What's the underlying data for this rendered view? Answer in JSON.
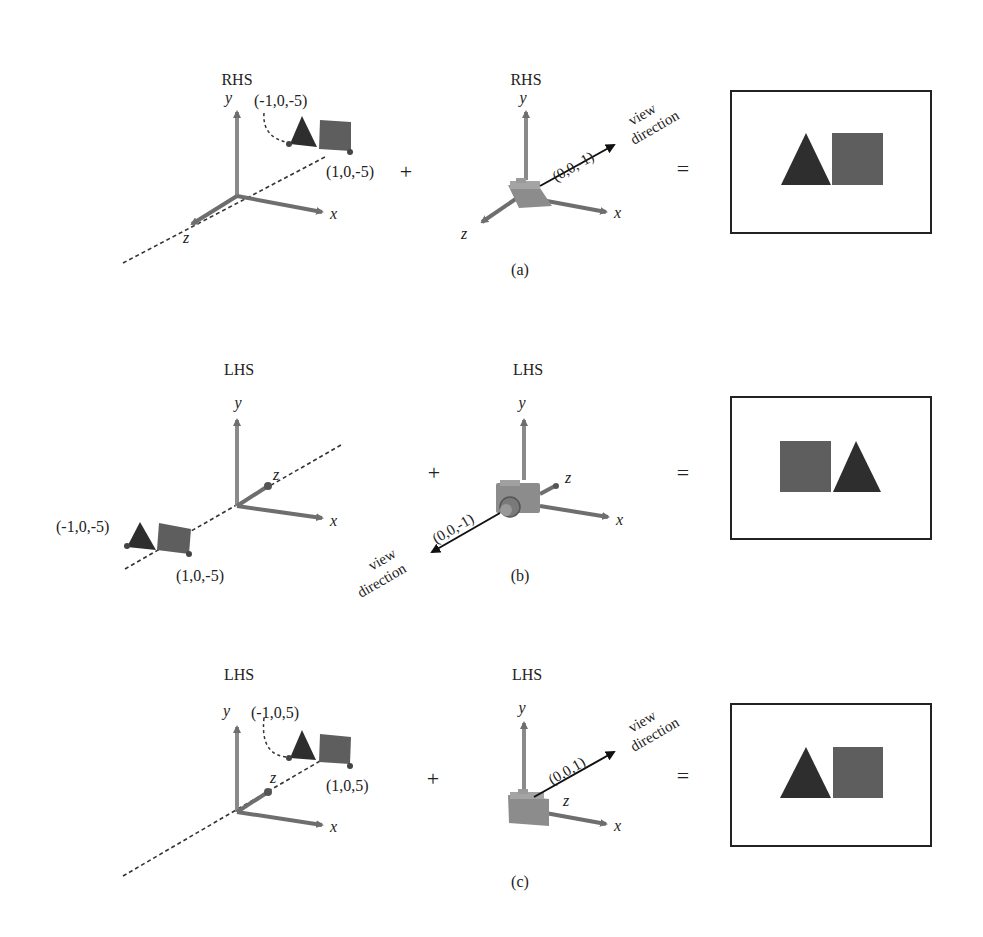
{
  "figure": {
    "panels": [
      {
        "id": "a",
        "caption": "(a)",
        "world": {
          "system_label": "RHS",
          "axis_labels": {
            "x": "x",
            "y": "y",
            "z": "z"
          },
          "point_left": "(-1,0,-5)",
          "point_right": "(1,0,-5)"
        },
        "camera": {
          "system_label": "RHS",
          "axis_labels": {
            "x": "x",
            "y": "y",
            "z": "z"
          },
          "direction_vector": "(0,0,-1)",
          "view_label_1": "view",
          "view_label_2": "direction"
        },
        "plus": "+",
        "equals": "=",
        "result_order": [
          "triangle",
          "square"
        ]
      },
      {
        "id": "b",
        "caption": "(b)",
        "world": {
          "system_label": "LHS",
          "axis_labels": {
            "x": "x",
            "y": "y",
            "z": "z"
          },
          "point_left": "(-1,0,-5)",
          "point_right": "(1,0,-5)"
        },
        "camera": {
          "system_label": "LHS",
          "axis_labels": {
            "x": "x",
            "y": "y",
            "z": "z"
          },
          "direction_vector": "(0,0,-1)",
          "view_label_1": "view",
          "view_label_2": "direction"
        },
        "plus": "+",
        "equals": "=",
        "result_order": [
          "square",
          "triangle"
        ]
      },
      {
        "id": "c",
        "caption": "(c)",
        "world": {
          "system_label": "LHS",
          "axis_labels": {
            "x": "x",
            "y": "y",
            "z": "z"
          },
          "point_left": "(-1,0,5)",
          "point_right": "(1,0,5)"
        },
        "camera": {
          "system_label": "LHS",
          "axis_labels": {
            "x": "x",
            "y": "y",
            "z": "z"
          },
          "direction_vector": "(0,0,1)",
          "view_label_1": "view",
          "view_label_2": "direction"
        },
        "plus": "+",
        "equals": "=",
        "result_order": [
          "triangle",
          "square"
        ]
      }
    ],
    "colors": {
      "axis": "#7a7a7a",
      "axis_y": "#8a8a8a",
      "triangle": "#2e2e2e",
      "square": "#5e5e5e",
      "camera": "#8c8c8c",
      "arrow": "#111111",
      "frame": "#222222"
    }
  }
}
